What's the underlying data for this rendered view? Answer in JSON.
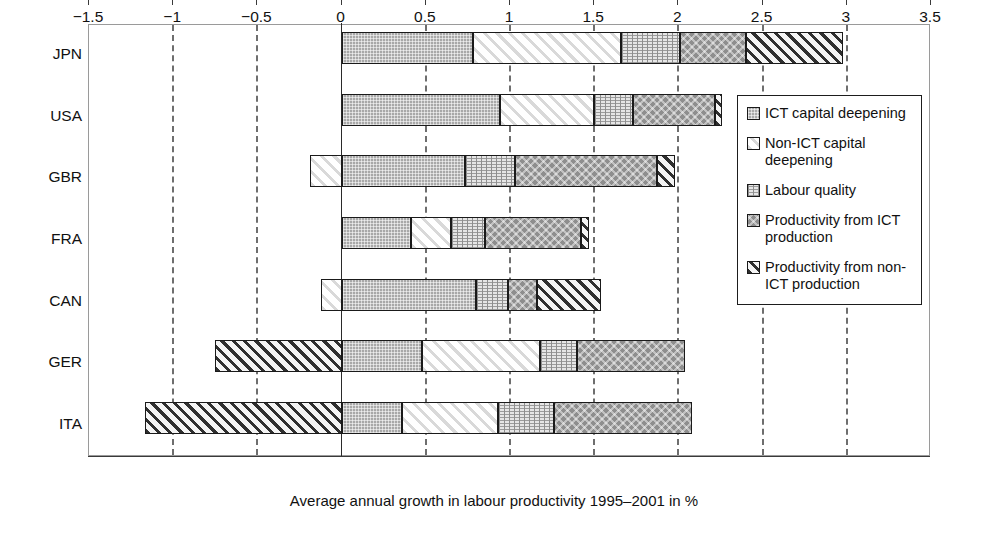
{
  "chart_data": {
    "type": "bar",
    "orientation": "horizontal",
    "stacked": true,
    "title": "",
    "xlabel": "Average annual growth in labour productivity 1995–2001 in %",
    "ylabel": "",
    "xlim": [
      -1.5,
      3.5
    ],
    "xticks": [
      "−1.5",
      "−1",
      "−0.5",
      "0",
      "0.5",
      "1",
      "1.5",
      "2",
      "2.5",
      "3",
      "3.5"
    ],
    "xtick_values": [
      -1.5,
      -1,
      -0.5,
      0,
      0.5,
      1,
      1.5,
      2,
      2.5,
      3,
      3.5
    ],
    "grid": "vertical-dashed",
    "legend_position": "right-inside",
    "categories": [
      "JPN",
      "USA",
      "GBR",
      "FRA",
      "CAN",
      "GER",
      "ITA"
    ],
    "series": [
      {
        "name": "ICT capital deepening",
        "key": "ict",
        "values": [
          0.78,
          0.94,
          0.73,
          0.41,
          0.8,
          0.48,
          0.36
        ]
      },
      {
        "name": "Non-ICT capital deepening",
        "key": "nonict",
        "values": [
          0.88,
          0.56,
          -0.19,
          0.24,
          -0.12,
          0.7,
          0.57
        ]
      },
      {
        "name": "Labour quality",
        "key": "labour",
        "values": [
          0.35,
          0.23,
          0.3,
          0.2,
          0.19,
          0.22,
          0.33
        ]
      },
      {
        "name": "Productivity from ICT production",
        "key": "ictprod",
        "values": [
          0.39,
          0.49,
          0.84,
          0.57,
          0.17,
          0.64,
          0.82
        ]
      },
      {
        "name": "Productivity from non-ICT production",
        "key": "nonictprod",
        "values": [
          0.58,
          0.04,
          0.11,
          0.05,
          0.38,
          -0.75,
          -1.17
        ]
      }
    ],
    "totals": [
      2.98,
      2.26,
      1.79,
      1.47,
      1.42,
      1.29,
      0.91
    ]
  },
  "legend": {
    "items": [
      {
        "label": "ICT capital deepening",
        "swatch": "ict"
      },
      {
        "label": "Non-ICT capital deepening",
        "swatch": "nonict"
      },
      {
        "label": "Labour quality",
        "swatch": "labour"
      },
      {
        "label": "Productivity from ICT production",
        "swatch": "ictprod"
      },
      {
        "label": "Productivity from non-ICT production",
        "swatch": "nonictprod"
      }
    ]
  },
  "colors": {
    "ict": "#a8a8a8",
    "nonict": "#fbfbfb",
    "labour": "#e6e6e6",
    "ictprod": "#8e8e8e",
    "nonictprod": "#f2f2f2",
    "axis": "#3a3a3a",
    "grid": "#6e6e6e",
    "border": "#1a1a1a"
  }
}
